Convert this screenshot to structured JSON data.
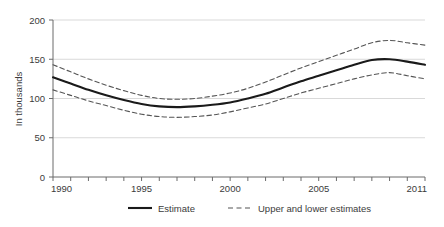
{
  "chart_data": {
    "type": "line",
    "title": "",
    "subtitle": "",
    "xlabel": "",
    "ylabel": "In thousands",
    "xlim": [
      1990,
      2011
    ],
    "ylim": [
      0,
      200
    ],
    "grid": true,
    "grid_axis": "y",
    "legend_position": "bottom",
    "x": [
      1990,
      1991,
      1992,
      1993,
      1994,
      1995,
      1996,
      1997,
      1998,
      1999,
      2000,
      2001,
      2002,
      2003,
      2004,
      2005,
      2006,
      2007,
      2008,
      2009,
      2010,
      2011
    ],
    "y_ticks": [
      0,
      50,
      100,
      150,
      200
    ],
    "x_ticks": [
      1990,
      1991,
      1992,
      1993,
      1994,
      1995,
      1996,
      1997,
      1998,
      1999,
      2000,
      2001,
      2002,
      2003,
      2004,
      2005,
      2006,
      2007,
      2008,
      2009,
      2010,
      2011
    ],
    "x_tick_labels_shown": [
      "1990",
      "1995",
      "2000",
      "2005",
      "2011"
    ],
    "series": [
      {
        "name": "Estimate",
        "style": "solid",
        "color": "#1a1a1a",
        "values": [
          127,
          119,
          111,
          104,
          98,
          93,
          90,
          89,
          90,
          92,
          95,
          100,
          106,
          114,
          122,
          129,
          136,
          143,
          149,
          150,
          147,
          143
        ]
      },
      {
        "name": "Upper estimate",
        "style": "dashed",
        "color": "#555555",
        "values": [
          143,
          134,
          125,
          117,
          110,
          104,
          100,
          99,
          100,
          103,
          107,
          113,
          121,
          130,
          139,
          147,
          155,
          163,
          171,
          174,
          171,
          168
        ]
      },
      {
        "name": "Lower estimate",
        "style": "dashed",
        "color": "#555555",
        "values": [
          111,
          104,
          97,
          91,
          85,
          80,
          77,
          76,
          77,
          79,
          83,
          88,
          93,
          100,
          107,
          113,
          119,
          125,
          130,
          133,
          129,
          125
        ]
      }
    ],
    "annotations": []
  },
  "axes": {
    "y_axis_title": "In thousands",
    "y_tick_labels": [
      "0",
      "50",
      "100",
      "150",
      "200"
    ],
    "x_tick_labels": [
      "1990",
      "1995",
      "2000",
      "2005",
      "2011"
    ]
  },
  "legend": {
    "items": [
      {
        "label": "Estimate",
        "style": "solid"
      },
      {
        "label": "Upper and lower estimates",
        "style": "dashed"
      }
    ]
  },
  "colors": {
    "estimate_line": "#1a1a1a",
    "bounds_line": "#555555",
    "gridline": "#d9d9d9",
    "axis": "#6b6b6b",
    "text": "#3b3b3b",
    "background": "#ffffff"
  }
}
